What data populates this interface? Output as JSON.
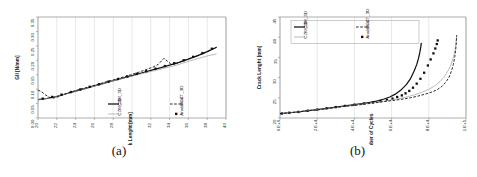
{
  "figure": {
    "panels": [
      {
        "id": "a",
        "caption": "(a)"
      },
      {
        "id": "b",
        "caption": "(b)"
      }
    ]
  },
  "series_names": {
    "czm_3d": "CZM_3D",
    "czm_2d": "CZM_2D",
    "vcct_3d": "VCCT_3D",
    "analytical": "Analytical"
  },
  "chart_data": [
    {
      "id": "a",
      "type": "line",
      "title": "",
      "xlabel": "Crack Lenght [mm]",
      "ylabel": "GII [N/mm]",
      "xlim": [
        20,
        40
      ],
      "ylim": [
        0.0,
        0.35
      ],
      "xticks": [
        20,
        22,
        24,
        26,
        28,
        30,
        32,
        34,
        36,
        38,
        40
      ],
      "xtick_labels": [
        "20",
        "22",
        "24",
        "26",
        "28",
        "30",
        "32",
        "34",
        "36",
        "38",
        "40"
      ],
      "yticks": [
        0.0,
        0.05,
        0.1,
        0.15,
        0.2,
        0.25,
        0.3,
        0.35
      ],
      "ytick_labels": [
        "0.00",
        "0.05",
        "0.10",
        "0.15",
        "0.20",
        "0.25",
        "0.30",
        "0.35"
      ],
      "grid": "vertical",
      "legend_position": "inside-bottom-center",
      "legend": [
        "CZM_3D",
        "VCCT_3D",
        "CZM_2D",
        "Analytical"
      ],
      "series": [
        {
          "name": "CZM_3D",
          "style": "solid-thick-black",
          "x": [
            20,
            21,
            22,
            23,
            24,
            25,
            26,
            27,
            28,
            29,
            30,
            31,
            32,
            33,
            34,
            35,
            36,
            37,
            38,
            39
          ],
          "y": [
            0.064,
            0.068,
            0.075,
            0.084,
            0.093,
            0.102,
            0.111,
            0.12,
            0.129,
            0.138,
            0.147,
            0.156,
            0.165,
            0.174,
            0.183,
            0.193,
            0.204,
            0.216,
            0.23,
            0.245
          ]
        },
        {
          "name": "CZM_2D",
          "style": "solid-thin-gray",
          "x": [
            20,
            21,
            22,
            23,
            24,
            25,
            26,
            27,
            28,
            29,
            30,
            31,
            32,
            33,
            34,
            35,
            36,
            37,
            38,
            39
          ],
          "y": [
            0.064,
            0.068,
            0.075,
            0.084,
            0.093,
            0.102,
            0.111,
            0.12,
            0.129,
            0.137,
            0.145,
            0.153,
            0.161,
            0.169,
            0.177,
            0.186,
            0.196,
            0.206,
            0.215,
            0.222
          ]
        },
        {
          "name": "VCCT_3D",
          "style": "dashed-black",
          "x": [
            20.0,
            20.4,
            20.8,
            21.2,
            21.6,
            22.0,
            22.6,
            23.2,
            23.8,
            24.4,
            25.0,
            25.6,
            26.2,
            26.8,
            27.4,
            28.0,
            28.6,
            29.2,
            29.8,
            30.4,
            31.0,
            31.6,
            32.2,
            32.8,
            33.4,
            33.8,
            34.2,
            34.8,
            35.4,
            36.0,
            36.6,
            37.2,
            37.8,
            38.4,
            39.0
          ],
          "y": [
            0.097,
            0.09,
            0.08,
            0.072,
            0.069,
            0.072,
            0.079,
            0.087,
            0.093,
            0.099,
            0.104,
            0.11,
            0.115,
            0.121,
            0.127,
            0.132,
            0.138,
            0.143,
            0.149,
            0.155,
            0.162,
            0.169,
            0.176,
            0.186,
            0.207,
            0.196,
            0.185,
            0.19,
            0.198,
            0.205,
            0.212,
            0.219,
            0.227,
            0.236,
            0.245
          ]
        },
        {
          "name": "Analytical",
          "style": "square-markers",
          "x": [
            20.5,
            21.5,
            22.5,
            23.5,
            24.5,
            25.5,
            26.5,
            27.5,
            28.5,
            29.5,
            30.5,
            31.5,
            32.5,
            33.5,
            34.5,
            35.5,
            36.5,
            37.5,
            38.5
          ],
          "y": [
            0.067,
            0.073,
            0.081,
            0.09,
            0.099,
            0.108,
            0.117,
            0.126,
            0.135,
            0.144,
            0.153,
            0.162,
            0.171,
            0.18,
            0.19,
            0.2,
            0.212,
            0.225,
            0.24
          ]
        }
      ]
    },
    {
      "id": "b",
      "type": "line",
      "title": "",
      "xlabel": "Number of Cycles",
      "ylabel": "Crack Lenght [mm]",
      "xlim": [
        0,
        100000
      ],
      "ylim": [
        20,
        45
      ],
      "xticks": [
        0,
        20000,
        40000,
        60000,
        80000,
        100000
      ],
      "xtick_labels": [
        "0.E+0",
        "2.E+4",
        "4.E+4",
        "6.E+4",
        "8.E+4",
        "1.E+5"
      ],
      "yticks": [
        20,
        25,
        30,
        35,
        40,
        45
      ],
      "ytick_labels": [
        "20",
        "25",
        "30",
        "35",
        "40",
        "45"
      ],
      "grid": "vertical",
      "legend_position": "inside-top-left",
      "legend": [
        "CZM_3D",
        "VCCT_3D",
        "CZM_2D",
        "Analytical"
      ],
      "series": [
        {
          "name": "CZM_3D",
          "style": "solid-thick-black",
          "x": [
            0,
            5000,
            10000,
            15000,
            20000,
            25000,
            30000,
            35000,
            40000,
            45000,
            50000,
            53000,
            56000,
            59000,
            62000,
            65000,
            68000,
            70000,
            72000,
            73500,
            74500,
            75200,
            75700,
            76000
          ],
          "y": [
            21.1,
            21.3,
            21.5,
            21.8,
            22.1,
            22.4,
            22.7,
            23.0,
            23.3,
            23.6,
            24.0,
            24.3,
            24.7,
            25.2,
            25.9,
            26.9,
            28.3,
            29.6,
            31.5,
            33.2,
            34.8,
            36.3,
            37.6,
            38.6
          ]
        },
        {
          "name": "Analytical",
          "style": "square-markers",
          "x": [
            1000,
            5000,
            10000,
            15000,
            20000,
            25000,
            30000,
            35000,
            40000,
            45000,
            50000,
            54000,
            57500,
            60500,
            63000,
            65500,
            67500,
            69500,
            71500,
            73500,
            75500,
            77500,
            79500,
            81000,
            82500,
            83500,
            84300,
            84800
          ],
          "y": [
            21.1,
            21.3,
            21.5,
            21.8,
            22.1,
            22.4,
            22.7,
            23.0,
            23.3,
            23.6,
            23.9,
            24.2,
            24.5,
            24.8,
            25.2,
            25.6,
            26.1,
            26.7,
            27.5,
            28.5,
            29.7,
            31.2,
            33.0,
            34.5,
            36.0,
            37.2,
            38.3,
            39.2
          ]
        },
        {
          "name": "CZM_2D",
          "style": "solid-thin-gray",
          "x": [
            0,
            5000,
            10000,
            15000,
            20000,
            25000,
            30000,
            35000,
            40000,
            45000,
            50000,
            55000,
            60000,
            64000,
            68000,
            72000,
            76000,
            80000,
            83000,
            86000,
            88500,
            90500,
            92000,
            93200,
            94000,
            94600,
            95000
          ],
          "y": [
            21.1,
            21.3,
            21.5,
            21.8,
            22.1,
            22.3,
            22.6,
            22.9,
            23.2,
            23.5,
            23.8,
            24.1,
            24.5,
            24.8,
            25.2,
            25.7,
            26.3,
            27.1,
            27.9,
            29.0,
            30.3,
            31.8,
            33.3,
            35.0,
            36.6,
            38.3,
            40.5
          ]
        },
        {
          "name": "VCCT_3D",
          "style": "dashed-black",
          "x": [
            0,
            5000,
            10000,
            15000,
            20000,
            25000,
            30000,
            35000,
            40000,
            45000,
            50000,
            55000,
            60000,
            65000,
            70000,
            74000,
            78000,
            81500,
            84500,
            87000,
            89000,
            90800,
            92200,
            93200,
            94000,
            94600,
            95000
          ],
          "y": [
            21.1,
            21.3,
            21.5,
            21.8,
            22.0,
            22.3,
            22.6,
            22.9,
            23.1,
            23.4,
            23.7,
            24.0,
            24.3,
            24.6,
            25.0,
            25.4,
            25.9,
            26.4,
            27.0,
            27.8,
            28.8,
            30.0,
            31.6,
            33.3,
            35.2,
            37.5,
            40.5
          ]
        }
      ]
    }
  ]
}
